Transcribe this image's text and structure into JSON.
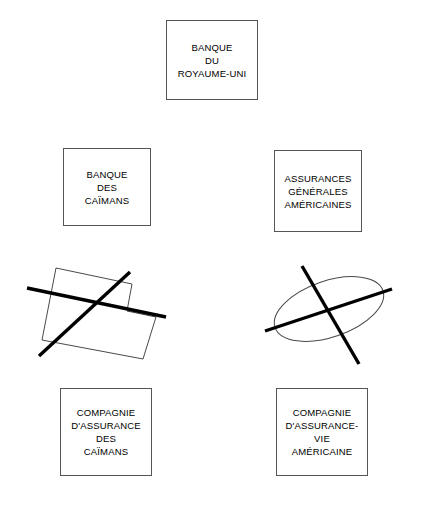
{
  "diagram": {
    "title_note": "",
    "boxes": [
      {
        "id": "banque-du-royaume-uni",
        "label": "BANQUE\nDU\nROYAUME-UNI",
        "x": 166,
        "y": 20,
        "width": 92,
        "height": 80
      },
      {
        "id": "banque-des-caimans",
        "label": "BANQUE\nDES\nCAÏMANS",
        "x": 63,
        "y": 148,
        "width": 88,
        "height": 78
      },
      {
        "id": "assurances-generales-americaines",
        "label": "ASSURANCES\nGÉNÉRALES\nAMÉRICAINES",
        "x": 274,
        "y": 150,
        "width": 88,
        "height": 82
      },
      {
        "id": "compagnie-assurance-des-caimans",
        "label": "COMPAGNIE\nD'ASSURANCE\nDES\nCAÏMANS",
        "x": 60,
        "y": 388,
        "width": 92,
        "height": 88
      },
      {
        "id": "compagnie-assurance-vie-americaine",
        "label": "COMPAGNIE\nD'ASSURANCE-\nVIE\nAMÉRICAINE",
        "x": 276,
        "y": 388,
        "width": 92,
        "height": 88
      }
    ],
    "crossed_shapes": [
      {
        "id": "crossed-polygon",
        "shape": "l-shaped-polygon",
        "description": "tilted L-shaped outline struck through with a large X"
      },
      {
        "id": "crossed-ellipse",
        "shape": "ellipse",
        "description": "tilted ellipse outline struck through with a large X"
      }
    ],
    "colors": {
      "box_border": "#555555",
      "outline_stroke": "#4a4a4a",
      "cross_stroke": "#000000",
      "background": "#ffffff",
      "text": "#000000"
    }
  }
}
